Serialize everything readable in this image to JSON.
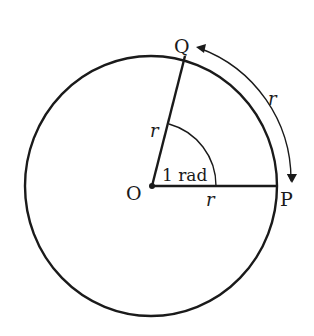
{
  "diagram": {
    "points": {
      "center": "O",
      "point_p": "P",
      "point_q": "Q"
    },
    "labels": {
      "radius_oq": "r",
      "radius_op": "r",
      "arc_pq": "r",
      "angle": "1 rad"
    },
    "colors": {
      "stroke": "#1a1a1a",
      "background": "#ffffff"
    }
  }
}
